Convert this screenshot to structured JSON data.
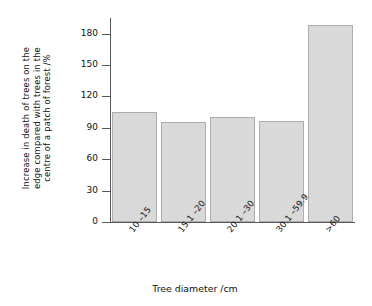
{
  "chart_data": {
    "type": "bar",
    "title": "",
    "subtitle": "",
    "categories": [
      "10 –15",
      "15.1 –20",
      "20.1 –30",
      "30.1 –59.9",
      ">60"
    ],
    "values": [
      105,
      96,
      100,
      97,
      188
    ],
    "series": [
      {
        "name": "Increase in death of trees",
        "values": [
          105,
          96,
          100,
          97,
          188
        ]
      }
    ],
    "xlabel": "Tree diameter /cm",
    "ylabel_lines": [
      "Increase in death of trees on the",
      "edge compared with trees in the",
      "centre of a patch of forest /%"
    ],
    "ylabel": "Increase in death of trees on the edge compared with trees in the centre of a patch of forest /%",
    "ylim": [
      0,
      195
    ],
    "ytick_values": [
      0,
      30,
      60,
      90,
      120,
      150,
      180
    ],
    "yticks": [
      "0",
      "30",
      "60",
      "90",
      "120",
      "150",
      "180"
    ],
    "grid": false,
    "legend": false,
    "legend_position": "none",
    "bar_fill_color": "#d9d9d9",
    "bar_edge_color": "#adadad",
    "axis_color": "#575757",
    "background_color": "#ffffff",
    "annotations": []
  }
}
